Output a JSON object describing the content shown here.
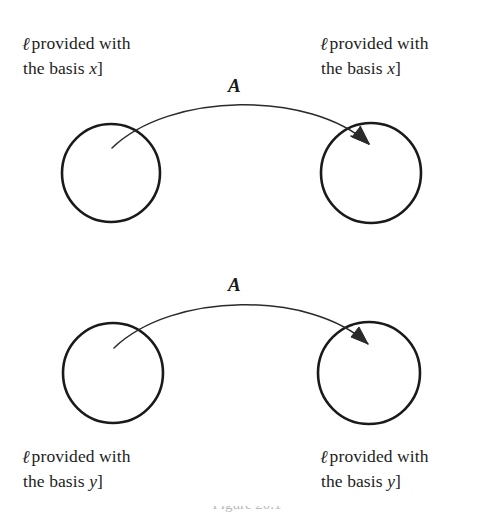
{
  "figure": {
    "title_caption_partial": "Figure 20.1",
    "nodes": [
      {
        "id": "top-left",
        "label_line1": "provided with",
        "label_line2": "the basis",
        "basis_symbol": "x",
        "bracket": "]",
        "set_symbol": "ℓ"
      },
      {
        "id": "top-right",
        "label_line1": "provided with",
        "label_line2": "the basis",
        "basis_symbol": "x",
        "bracket": "]",
        "set_symbol": "ℓ"
      },
      {
        "id": "bottom-left",
        "label_line1": "provided with",
        "label_line2": "the basis",
        "basis_symbol": "y",
        "bracket": "]",
        "set_symbol": "ℓ"
      },
      {
        "id": "bottom-right",
        "label_line1": "provided with",
        "label_line2": "the basis",
        "basis_symbol": "y",
        "bracket": "]",
        "set_symbol": "ℓ"
      }
    ],
    "arrows": [
      {
        "id": "top-arrow",
        "label": "A"
      },
      {
        "id": "bottom-arrow",
        "label": "A"
      }
    ],
    "colors": {
      "ink": "#1a1a1a",
      "background": "#ffffff",
      "faint": "#b9b9b9"
    }
  }
}
